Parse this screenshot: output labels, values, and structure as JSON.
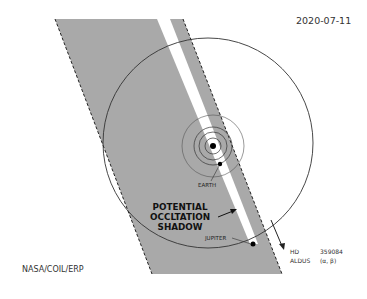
{
  "date": "2020-07-11",
  "credit": "NASA/COIL/ERP",
  "labels": {
    "shadow_line1": "POTENTIAL",
    "shadow_line2": "OCCLTATION",
    "shadow_line3": "SHADOW",
    "earth": "EARTH",
    "jupiter": "JUPITER"
  },
  "star": {
    "row1_key": "HD",
    "row1_val": "359084",
    "row2_key": "ALDUS",
    "row2_val": "(α, β)"
  },
  "colors": {
    "shadow_band": "#a9a9a9",
    "stripe": "#ffffff",
    "lines": "#333333"
  }
}
